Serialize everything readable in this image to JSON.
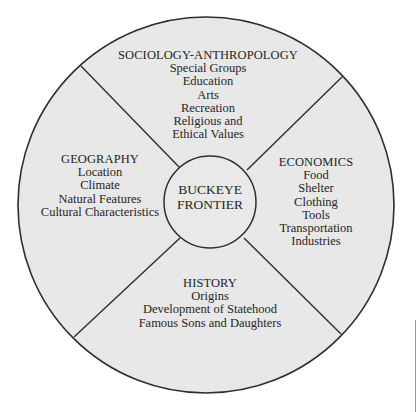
{
  "diagram": {
    "type": "wheel",
    "center": {
      "lines": [
        "BUCKEYE",
        "FRONTIER"
      ]
    },
    "segments": {
      "top": {
        "heading": "SOCIOLOGY-ANTHROPOLOGY",
        "items": [
          "Special Groups",
          "Education",
          "Arts",
          "Recreation",
          "Religious and",
          "Ethical Values"
        ]
      },
      "left": {
        "heading": "GEOGRAPHY",
        "items": [
          "Location",
          "Climate",
          "Natural Features",
          "Cultural Characteristics"
        ]
      },
      "right": {
        "heading": "ECONOMICS",
        "items": [
          "Food",
          "Shelter",
          "Clothing",
          "Tools",
          "Transportation",
          "Industries"
        ]
      },
      "bottom": {
        "heading": "HISTORY",
        "items": [
          "Origins",
          "Development of Statehood",
          "Famous Sons and Daughters"
        ]
      }
    },
    "colors": {
      "fill": "#e9e9e9",
      "stroke": "#2e2e2e",
      "text": "#262626",
      "background": "#ffffff"
    }
  }
}
